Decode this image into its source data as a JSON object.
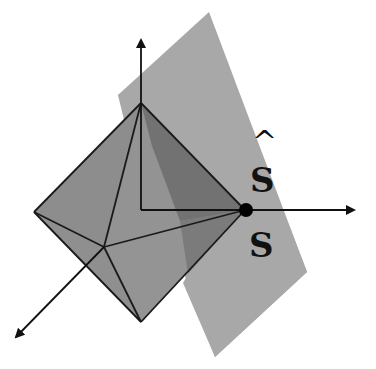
{
  "diagram": {
    "labels": {
      "s_hat": "S",
      "s_hat_accent": "^",
      "s": "S"
    },
    "colors": {
      "background": "#ffffff",
      "plane": "#a8a8a8",
      "octahedron_face": "#8e8e8e",
      "octahedron_shaded_face": "#6f6f6f",
      "edge": "#1a1a1a",
      "axis": "#111111",
      "point": "#000000"
    },
    "points": {
      "origin": [
        141,
        210
      ],
      "top_vertex": [
        141,
        103
      ],
      "left_vertex": [
        34,
        212
      ],
      "right_vertex": [
        245,
        210
      ],
      "bottom_vertex": [
        141,
        322
      ],
      "front_vertex": [
        104,
        247
      ]
    },
    "axes": [
      {
        "name": "z-axis",
        "from": [
          141,
          210
        ],
        "to": [
          141,
          38
        ]
      },
      {
        "name": "x-axis",
        "from": [
          141,
          210
        ],
        "to": [
          356,
          210
        ]
      },
      {
        "name": "y-axis",
        "from": [
          104,
          247
        ],
        "to": [
          14,
          339
        ]
      }
    ],
    "plane_polygon": [
      [
        118,
        95
      ],
      [
        209,
        12
      ],
      [
        307,
        272
      ],
      [
        215,
        357
      ]
    ]
  }
}
